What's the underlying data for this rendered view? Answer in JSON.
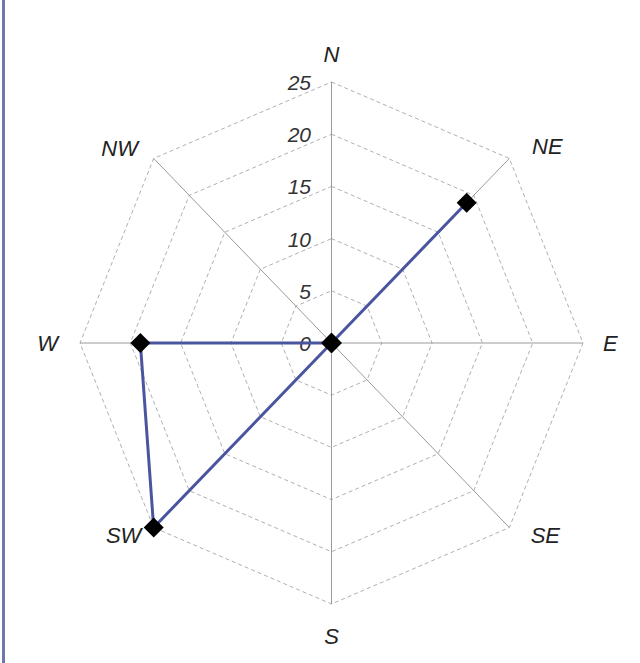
{
  "chart_data": {
    "type": "radar",
    "title": "",
    "categories": [
      "N",
      "NE",
      "E",
      "SE",
      "S",
      "SW",
      "W",
      "NW"
    ],
    "series": [
      {
        "name": "",
        "values": [
          0,
          19,
          0,
          0,
          0,
          25,
          19,
          0
        ],
        "color": "#4a55a0",
        "marker": "diamond",
        "marker_color": "#000000"
      }
    ],
    "radial_axis": {
      "range": [
        0,
        25
      ],
      "ticks": [
        0,
        5,
        10,
        15,
        20,
        25
      ],
      "tick_labels": [
        "0",
        "5",
        "10",
        "15",
        "20",
        "25"
      ]
    },
    "grid": "dashed octagonal rings",
    "legend": "none"
  },
  "colors": {
    "frame_line": "#6f78ad",
    "axis": "#9a9a9a",
    "grid": "#b0b0b0",
    "series": "#4a55a0"
  }
}
